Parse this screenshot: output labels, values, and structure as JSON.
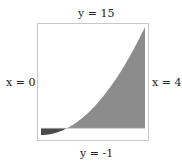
{
  "labels": {
    "top": "y = 15",
    "bottom": "y = -1",
    "left": "x = 0",
    "right": "x = 4"
  },
  "chart_data": {
    "type": "area",
    "function": "y = x^2 - 1",
    "x_range": [
      0,
      4
    ],
    "y_range": [
      -1,
      15
    ],
    "bounds": {
      "x_min": 0,
      "x_max": 4,
      "y_min": -1,
      "y_max": 15
    },
    "regions": [
      {
        "name": "below-x-axis",
        "x": [
          0,
          1
        ],
        "color": "#4a4a4a"
      },
      {
        "name": "above-x-axis",
        "x": [
          1,
          4
        ],
        "color": "#8c8c8c"
      }
    ]
  },
  "colors": {
    "fill_dark": "#4a4a4a",
    "fill_light": "#8c8c8c",
    "frame": "#c8c8c8"
  }
}
